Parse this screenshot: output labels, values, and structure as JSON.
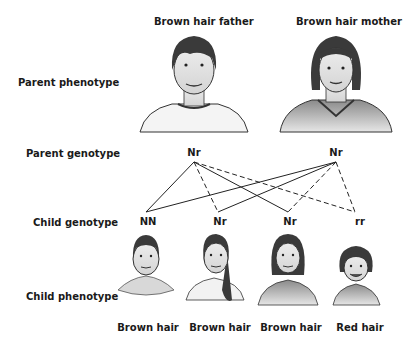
{
  "parents": {
    "father_label": "Brown hair father",
    "mother_label": "Brown hair mother",
    "father_genotype": "Nr",
    "mother_genotype": "Nr"
  },
  "rows": {
    "parent_phenotype": "Parent phenotype",
    "parent_genotype": "Parent genotype",
    "child_genotype": "Child genotype",
    "child_phenotype": "Child phenotype"
  },
  "children": [
    {
      "genotype": "NN",
      "phenotype": "Brown hair"
    },
    {
      "genotype": "Nr",
      "phenotype": "Brown hair"
    },
    {
      "genotype": "Nr",
      "phenotype": "Brown hair"
    },
    {
      "genotype": "rr",
      "phenotype": "Red hair"
    }
  ],
  "legend_note": {
    "solid_line": "N allele inherited",
    "dashed_line": "r allele inherited"
  }
}
